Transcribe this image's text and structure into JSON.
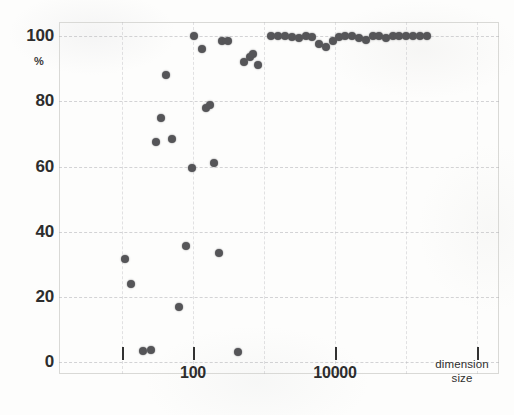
{
  "chart_data": {
    "type": "scatter",
    "title": "",
    "xlabel": "dimension size",
    "ylabel": "%",
    "xscale": "log",
    "xlim": [
      10,
      1000000
    ],
    "ylim": [
      0,
      105
    ],
    "grid": true,
    "legend": null,
    "xticks": [
      {
        "value": 10,
        "label": ""
      },
      {
        "value": 100,
        "label": "100"
      },
      {
        "value": 10000,
        "label": "10000"
      },
      {
        "value": 1000000,
        "label": ""
      }
    ],
    "yticks": [
      {
        "value": 0,
        "label": "0"
      },
      {
        "value": 20,
        "label": "20"
      },
      {
        "value": 40,
        "label": "40"
      },
      {
        "value": 60,
        "label": "60"
      },
      {
        "value": 80,
        "label": "80"
      },
      {
        "value": 100,
        "label": "100"
      }
    ],
    "points": [
      {
        "x": 11.0,
        "y": 31.5
      },
      {
        "x": 13.5,
        "y": 24.0
      },
      {
        "x": 20.0,
        "y": 3.5
      },
      {
        "x": 26.0,
        "y": 3.8
      },
      {
        "x": 30.0,
        "y": 67.5
      },
      {
        "x": 35.0,
        "y": 75.0
      },
      {
        "x": 41.0,
        "y": 88.0
      },
      {
        "x": 50.0,
        "y": 68.5
      },
      {
        "x": 63.0,
        "y": 17.0
      },
      {
        "x": 80.0,
        "y": 35.5
      },
      {
        "x": 97.0,
        "y": 59.5
      },
      {
        "x": 103.0,
        "y": 100.0
      },
      {
        "x": 135.0,
        "y": 96.0
      },
      {
        "x": 150.0,
        "y": 78.0
      },
      {
        "x": 175.0,
        "y": 79.0
      },
      {
        "x": 195.0,
        "y": 61.0
      },
      {
        "x": 230.0,
        "y": 33.5
      },
      {
        "x": 255.0,
        "y": 98.5
      },
      {
        "x": 310.0,
        "y": 98.5
      },
      {
        "x": 430.0,
        "y": 3.0
      },
      {
        "x": 520.0,
        "y": 92.0
      },
      {
        "x": 640.0,
        "y": 93.5
      },
      {
        "x": 700.0,
        "y": 94.5
      },
      {
        "x": 820.0,
        "y": 91.0
      },
      {
        "x": 1250.0,
        "y": 100.0
      },
      {
        "x": 1600.0,
        "y": 100.0
      },
      {
        "x": 2000.0,
        "y": 100.0
      },
      {
        "x": 2500.0,
        "y": 99.7
      },
      {
        "x": 3100.0,
        "y": 99.5
      },
      {
        "x": 3900.0,
        "y": 100.0
      },
      {
        "x": 4800.0,
        "y": 99.6
      },
      {
        "x": 6000.0,
        "y": 97.5
      },
      {
        "x": 7500.0,
        "y": 96.5
      },
      {
        "x": 9300.0,
        "y": 98.5
      },
      {
        "x": 11500.0,
        "y": 99.8
      },
      {
        "x": 14000.0,
        "y": 100.0
      },
      {
        "x": 17500.0,
        "y": 100.0
      },
      {
        "x": 22000.0,
        "y": 99.5
      },
      {
        "x": 27000.0,
        "y": 98.8
      },
      {
        "x": 34000.0,
        "y": 100.0
      },
      {
        "x": 42000.0,
        "y": 100.0
      },
      {
        "x": 52000.0,
        "y": 99.3
      },
      {
        "x": 65000.0,
        "y": 100.0
      },
      {
        "x": 80000.0,
        "y": 100.0
      },
      {
        "x": 100000.0,
        "y": 100.0
      },
      {
        "x": 125000.0,
        "y": 100.0
      },
      {
        "x": 155000.0,
        "y": 100.0
      },
      {
        "x": 195000.0,
        "y": 100.0
      }
    ]
  },
  "axis": {
    "y_unit": "%",
    "x_title_line1": "dimension",
    "x_title_line2": "size"
  },
  "style": {
    "point_color": "#555558",
    "text_color": "#2d2d2d",
    "grid_color": "#b0b0b4",
    "frame_color": "#d9d9d6",
    "background": "#fdfdfc"
  }
}
